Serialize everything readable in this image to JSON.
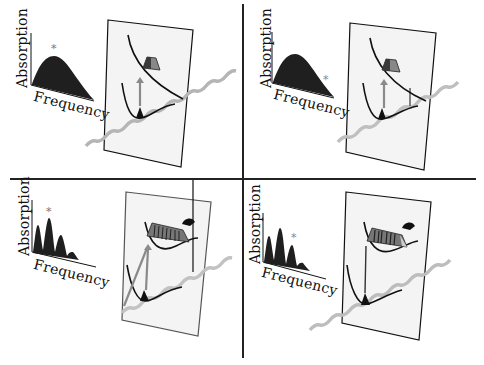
{
  "figure": {
    "panels": [
      {
        "id": "top-left",
        "spectrum": {
          "type": "broad",
          "x_label": "Frequency",
          "y_label": "Absorption",
          "marker": "*",
          "marker_position": "peak"
        },
        "diagram": {
          "excitation_arrow": "vertical-gray",
          "excited_state": "dissociative",
          "band_pattern": "narrow-wedge",
          "curl_arrow": false
        }
      },
      {
        "id": "top-right",
        "spectrum": {
          "type": "broad",
          "x_label": "Frequency",
          "y_label": "Absorption",
          "marker": "*",
          "marker_position": "tail"
        },
        "diagram": {
          "excitation_arrow": "vertical-gray",
          "excited_state": "dissociative",
          "band_pattern": "narrow-wedge",
          "curl_arrow": false
        }
      },
      {
        "id": "bottom-left",
        "spectrum": {
          "type": "vibronic-progression",
          "x_label": "Frequency",
          "y_label": "Absorption",
          "marker": "*",
          "marker_position": "second-peak"
        },
        "diagram": {
          "excitation_arrow": "vertical-gray-plus-diagonal",
          "excited_state": "bound",
          "band_pattern": "striped-wedge",
          "curl_arrow": true
        }
      },
      {
        "id": "bottom-right",
        "spectrum": {
          "type": "vibronic-progression",
          "x_label": "Frequency",
          "y_label": "Absorption",
          "marker": "*",
          "marker_position": "third-peak"
        },
        "diagram": {
          "excitation_arrow": "vertical-dark",
          "excited_state": "bound",
          "band_pattern": "striped-wedge",
          "curl_arrow": true
        }
      }
    ],
    "colors": {
      "ink": "#111111",
      "fill": "#222222",
      "arrow": "#8a8a8a",
      "plate": "#f4f4f4",
      "wave": "#b5b5b5",
      "divider": "#222222"
    }
  }
}
